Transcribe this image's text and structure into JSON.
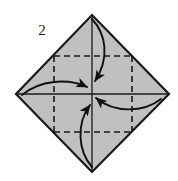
{
  "figure": {
    "kind": "origami-fold-diagram",
    "step_label": "2",
    "background_color": "#ffffff",
    "paper_fill_color": "#c0c0c0",
    "paper_outline_color": "#1a1a1a",
    "crease_line_color": "#1a1a1a",
    "arrow_color": "#111111",
    "canvas": {
      "width": 178,
      "height": 181
    }
  },
  "shape": {
    "name": "diamond-square",
    "description": "square sheet rotated 45 degrees",
    "vertices": {
      "top": {
        "x": 92,
        "y": 15
      },
      "right": {
        "x": 169,
        "y": 94
      },
      "bottom": {
        "x": 92,
        "y": 172
      },
      "left": {
        "x": 16,
        "y": 94
      }
    },
    "center": {
      "x": 92,
      "y": 94
    }
  },
  "creases": {
    "solid": [
      {
        "name": "horizontal-center-crease",
        "x1": 16,
        "y1": 94,
        "x2": 169,
        "y2": 94
      },
      {
        "name": "vertical-center-crease",
        "x1": 92,
        "y1": 15,
        "x2": 92,
        "y2": 172
      }
    ],
    "dashed_square": {
      "name": "inner-dashed-square",
      "left": 54,
      "top": 56,
      "right": 132,
      "bottom": 132,
      "dash_pattern": "6 4"
    }
  },
  "arrows": [
    {
      "name": "fold-arrow-top",
      "direction": "down",
      "description": "top corner folds down to center",
      "path": "M 92 19 C 106 34, 110 58, 95 81",
      "head": {
        "x": 95,
        "y": 82,
        "angle_deg": 122
      }
    },
    {
      "name": "fold-arrow-left",
      "direction": "right",
      "description": "left corner folds right to center",
      "path": "M 22 95 C 40 80, 68 78, 87 87",
      "head": {
        "x": 88,
        "y": 88,
        "angle_deg": 28
      }
    },
    {
      "name": "fold-arrow-right",
      "direction": "left",
      "description": "right corner folds left to center",
      "path": "M 161 99 C 143 113, 114 113, 96 98",
      "head": {
        "x": 95,
        "y": 97,
        "angle_deg": 213
      }
    },
    {
      "name": "fold-arrow-bottom",
      "direction": "up",
      "description": "bottom corner folds up to center",
      "path": "M 92 167 C 78 151, 76 124, 90 105",
      "head": {
        "x": 90,
        "y": 103,
        "angle_deg": 303
      }
    }
  ],
  "labels": {
    "step_number": {
      "text": "2",
      "x": 42,
      "y": 35
    }
  }
}
